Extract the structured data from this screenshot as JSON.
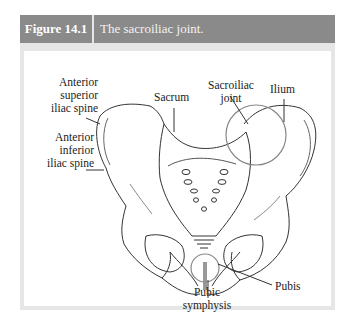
{
  "figure": {
    "number": "Figure 14.1",
    "title": "The sacroiliac joint.",
    "header_color": "#8a8a8a",
    "frame_color": "#e6e6e6"
  },
  "labels": {
    "asis": [
      "Anterior",
      "superior",
      "iliac spine"
    ],
    "aiis": [
      "Anterior",
      "inferior",
      "iliac spine"
    ],
    "sacrum": "Sacrum",
    "si_joint": [
      "Sacroiliac",
      "joint"
    ],
    "ilium": "Ilium",
    "pubis": "Pubis",
    "pubic_symphysis": [
      "Pubic",
      "symphysis"
    ]
  }
}
